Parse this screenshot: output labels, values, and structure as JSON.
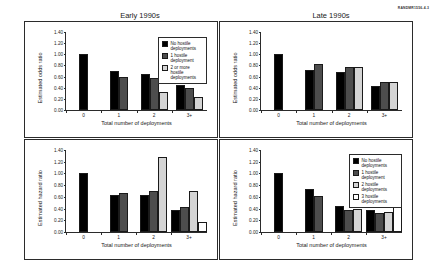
{
  "figure": {
    "rand_tag": "RANDMR1556-4.3",
    "row_labels": [
      "Junior officers",
      "Midgrade officers"
    ],
    "column_titles": [
      "Early 1990s",
      "Late 1990s"
    ]
  },
  "colors": {
    "series_0": "#000000",
    "series_1": "#4d4d4d",
    "series_2": "#d4d4d4",
    "series_3": "#ffffff",
    "axis": "#2b2b2b",
    "text": "#1a1a1a"
  },
  "chart_data": [
    {
      "type": "bar",
      "panel": "top-left",
      "title": "Early 1990s",
      "row_label": "Junior officers",
      "xlabel": "Total number of deployments",
      "ylabel": "Estimated odds ratio",
      "categories": [
        "0",
        "1",
        "2",
        "3+"
      ],
      "ylim": [
        0.0,
        1.4
      ],
      "yticks": [
        "0.00",
        "0.20",
        "0.40",
        "0.60",
        "0.80",
        "1.00",
        "1.20",
        "1.40"
      ],
      "grid": false,
      "legend_position": "top-right-inside",
      "series": [
        {
          "name": "No hostile deployments",
          "values": [
            1.0,
            0.7,
            0.65,
            0.45
          ]
        },
        {
          "name": "1 hostile deployment",
          "values": [
            null,
            0.6,
            0.57,
            0.4
          ]
        },
        {
          "name": "2 or more hostile\ndeployments",
          "values": [
            null,
            null,
            0.33,
            0.23
          ]
        }
      ]
    },
    {
      "type": "bar",
      "panel": "top-right",
      "title": "Late 1990s",
      "row_label": "Junior officers",
      "xlabel": "Total number of deployments",
      "ylabel": "Estimated odds ratio",
      "categories": [
        "0",
        "1",
        "2",
        "3+"
      ],
      "ylim": [
        0.0,
        1.4
      ],
      "yticks": [
        "0.00",
        "0.20",
        "0.40",
        "0.60",
        "0.80",
        "1.00",
        "1.20",
        "1.40"
      ],
      "grid": false,
      "legend_position": "none",
      "series": [
        {
          "name": "No hostile deployments",
          "values": [
            1.0,
            0.72,
            0.68,
            0.44
          ]
        },
        {
          "name": "1 hostile deployment",
          "values": [
            null,
            0.83,
            0.78,
            0.51
          ]
        },
        {
          "name": "2 or more hostile\ndeployments",
          "values": [
            null,
            null,
            0.78,
            0.51
          ]
        }
      ]
    },
    {
      "type": "bar",
      "panel": "bottom-left",
      "title": "Early 1990s",
      "row_label": "Midgrade officers",
      "xlabel": "Total number of deployments",
      "ylabel": "Estimated hazard ratio",
      "categories": [
        "0",
        "1",
        "2",
        "3+"
      ],
      "ylim": [
        0.0,
        1.4
      ],
      "yticks": [
        "0.00",
        "0.20",
        "0.40",
        "0.60",
        "0.80",
        "1.00",
        "1.20",
        "1.40"
      ],
      "grid": false,
      "legend_position": "none",
      "series": [
        {
          "name": "No hostile deployments",
          "values": [
            1.0,
            0.63,
            0.63,
            0.38
          ]
        },
        {
          "name": "1 hostile deployment",
          "values": [
            null,
            0.67,
            0.7,
            0.42
          ]
        },
        {
          "name": "2 hostile deployments",
          "values": [
            null,
            null,
            1.28,
            0.7
          ]
        },
        {
          "name": "3 hostile deployments",
          "values": [
            null,
            null,
            null,
            0.17
          ]
        }
      ]
    },
    {
      "type": "bar",
      "panel": "bottom-right",
      "title": "Late 1990s",
      "row_label": "Midgrade officers",
      "xlabel": "Total number of deployments",
      "ylabel": "Estimated hazard ratio",
      "categories": [
        "0",
        "1",
        "2",
        "3+"
      ],
      "ylim": [
        0.0,
        1.4
      ],
      "yticks": [
        "0.00",
        "0.20",
        "0.40",
        "0.60",
        "0.80",
        "1.00",
        "1.20",
        "1.40"
      ],
      "grid": false,
      "legend_position": "top-right-inside",
      "series": [
        {
          "name": "No hostile deployments",
          "values": [
            1.0,
            0.74,
            0.45,
            0.38
          ]
        },
        {
          "name": "1 hostile deployment",
          "values": [
            null,
            0.62,
            0.38,
            0.32
          ]
        },
        {
          "name": "2 hostile deployments",
          "values": [
            null,
            null,
            0.4,
            0.34
          ]
        },
        {
          "name": "3 hostile deployments",
          "values": [
            null,
            null,
            null,
            0.59
          ]
        }
      ]
    }
  ],
  "legends": {
    "top_left": [
      "No hostile deployments",
      "1 hostile deployment",
      "2 or more hostile\ndeployments"
    ],
    "bottom_right": [
      "No hostile deployments",
      "1 hostile deployment",
      "2 hostile deployments",
      "3 hostile deployments"
    ]
  }
}
